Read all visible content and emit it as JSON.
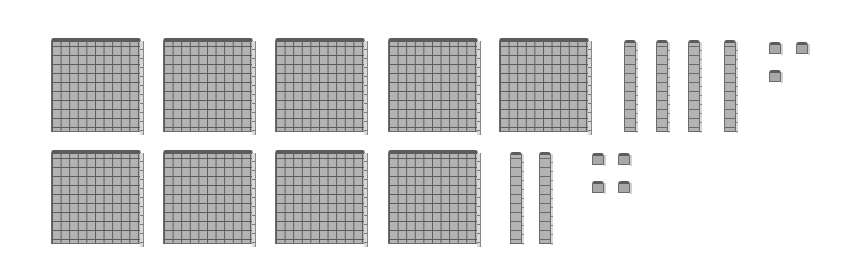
{
  "diagram": {
    "type": "base-ten-blocks",
    "colors": {
      "fill": "#b3b3b3",
      "grid": "#5a5a5a",
      "top_edge": "#5c5c5c",
      "side_face": "#d8d8d8"
    },
    "rows": [
      {
        "hundreds": 5,
        "tens": 4,
        "ones": 3,
        "value": 543
      },
      {
        "hundreds": 4,
        "tens": 2,
        "ones": 4,
        "value": 424
      }
    ]
  }
}
